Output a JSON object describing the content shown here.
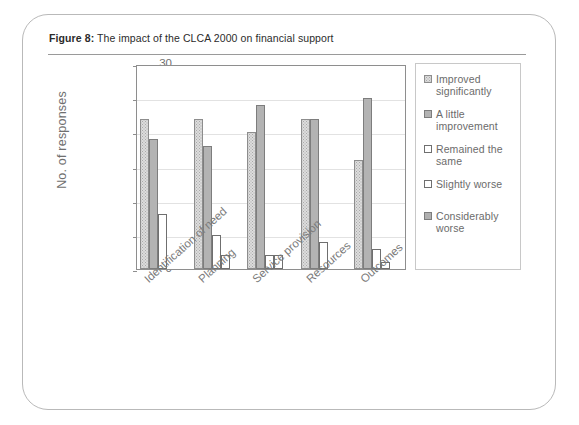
{
  "card": {
    "figure_prefix": "Figure 8:",
    "title": "The impact of the CLCA 2000 on financial support"
  },
  "chart_data": {
    "type": "bar",
    "title": "The impact of the CLCA 2000 on financial support",
    "xlabel": "",
    "ylabel": "No. of responses",
    "ylim": [
      0,
      30
    ],
    "yticks": [
      0,
      5,
      10,
      15,
      20,
      25,
      30
    ],
    "grid": true,
    "legend_position": "right",
    "categories": [
      "Identification of need",
      "Planning",
      "Service provision",
      "Resources",
      "Outcomes"
    ],
    "series": [
      {
        "name": "Improved significantly",
        "color": "#dcdcdc",
        "values": [
          22,
          22,
          20,
          22,
          16
        ]
      },
      {
        "name": "A little improvement",
        "color": "#b3b3b3",
        "values": [
          19,
          18,
          24,
          22,
          25
        ]
      },
      {
        "name": "Remained the same",
        "color": "#ffffff",
        "values": [
          8,
          5,
          2,
          4,
          3
        ]
      },
      {
        "name": "Slightly worse",
        "color": "#ffffff",
        "values": [
          0,
          2,
          2,
          0,
          1
        ]
      },
      {
        "name": "Considerably worse",
        "color": "#b0b0b0",
        "values": [
          0,
          0,
          0,
          0,
          0
        ]
      }
    ]
  }
}
